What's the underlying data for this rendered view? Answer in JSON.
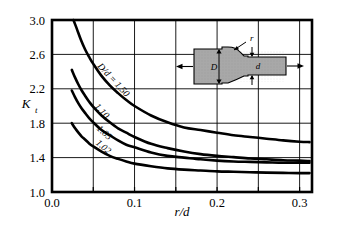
{
  "chart_data": {
    "type": "line",
    "title": "",
    "subtitle": "",
    "xlabel": "r/d",
    "ylabel": "Kt",
    "ylabel_main": "K",
    "ylabel_sub": "t",
    "xlim": [
      0.0,
      0.315
    ],
    "ylim": [
      1.0,
      3.0
    ],
    "xticks": [
      0.0,
      0.05,
      0.1,
      0.15,
      0.2,
      0.25,
      0.3
    ],
    "xticklabels": [
      "0.0",
      "",
      "0.1",
      "",
      "0.2",
      "",
      "0.3"
    ],
    "yticks": [
      1.0,
      1.4,
      1.8,
      2.2,
      2.6,
      3.0
    ],
    "yticklabels": [
      "1.0",
      "1.4",
      "1.8",
      "2.2",
      "2.6",
      "3.0"
    ],
    "grid": true,
    "grid_color": "#000000",
    "legend_position": "inline-curve-labels",
    "line_color": "#000000",
    "series": [
      {
        "name": "D/d = 1.50",
        "label": "D/d = 1.50",
        "label_x": 0.072,
        "label_y": 2.28,
        "label_rotation": 47,
        "x": [
          0.026,
          0.03,
          0.035,
          0.04,
          0.045,
          0.05,
          0.06,
          0.07,
          0.08,
          0.09,
          0.1,
          0.12,
          0.14,
          0.16,
          0.18,
          0.2,
          0.22,
          0.24,
          0.26,
          0.28,
          0.3,
          0.312
        ],
        "y": [
          3.0,
          2.9,
          2.77,
          2.66,
          2.57,
          2.49,
          2.35,
          2.24,
          2.15,
          2.07,
          2.0,
          1.89,
          1.81,
          1.75,
          1.72,
          1.69,
          1.66,
          1.64,
          1.62,
          1.6,
          1.585,
          1.58
        ]
      },
      {
        "name": "D/d = 1.10",
        "label": "1.10",
        "label_x": 0.058,
        "label_y": 1.92,
        "label_rotation": 47,
        "x": [
          0.024,
          0.028,
          0.032,
          0.036,
          0.04,
          0.045,
          0.05,
          0.06,
          0.07,
          0.08,
          0.09,
          0.1,
          0.12,
          0.14,
          0.16,
          0.18,
          0.2,
          0.22,
          0.24,
          0.26,
          0.28,
          0.3,
          0.312
        ],
        "y": [
          2.42,
          2.33,
          2.25,
          2.18,
          2.12,
          2.05,
          1.99,
          1.89,
          1.81,
          1.74,
          1.69,
          1.64,
          1.56,
          1.51,
          1.47,
          1.44,
          1.42,
          1.405,
          1.39,
          1.38,
          1.37,
          1.365,
          1.36
        ]
      },
      {
        "name": "D/d = 1.05",
        "label": "1.05",
        "label_x": 0.061,
        "label_y": 1.665,
        "label_rotation": 42,
        "x": [
          0.024,
          0.028,
          0.032,
          0.036,
          0.04,
          0.045,
          0.05,
          0.06,
          0.07,
          0.08,
          0.09,
          0.1,
          0.12,
          0.14,
          0.16,
          0.18,
          0.2,
          0.22,
          0.24,
          0.26,
          0.28,
          0.3,
          0.312
        ],
        "y": [
          2.18,
          2.1,
          2.03,
          1.97,
          1.92,
          1.86,
          1.81,
          1.72,
          1.66,
          1.6,
          1.55,
          1.52,
          1.46,
          1.42,
          1.4,
          1.38,
          1.365,
          1.355,
          1.35,
          1.345,
          1.34,
          1.34,
          1.34
        ]
      },
      {
        "name": "D/d = 1.02",
        "label": "1.02",
        "label_x": 0.06,
        "label_y": 1.5,
        "label_rotation": 40,
        "x": [
          0.024,
          0.028,
          0.032,
          0.036,
          0.04,
          0.045,
          0.05,
          0.06,
          0.07,
          0.08,
          0.09,
          0.1,
          0.12,
          0.14,
          0.16,
          0.18,
          0.2,
          0.22,
          0.24,
          0.26,
          0.28,
          0.3,
          0.312
        ],
        "y": [
          1.8,
          1.74,
          1.69,
          1.645,
          1.61,
          1.565,
          1.53,
          1.47,
          1.42,
          1.385,
          1.355,
          1.33,
          1.3,
          1.275,
          1.26,
          1.25,
          1.24,
          1.235,
          1.23,
          1.225,
          1.222,
          1.22,
          1.22
        ]
      }
    ]
  },
  "inset": {
    "name": "stepped-shaft-in-tension",
    "fill_color": "#a8a8a8",
    "labels": {
      "large_diameter": "D",
      "small_diameter": "d",
      "fillet_radius": "r"
    }
  }
}
